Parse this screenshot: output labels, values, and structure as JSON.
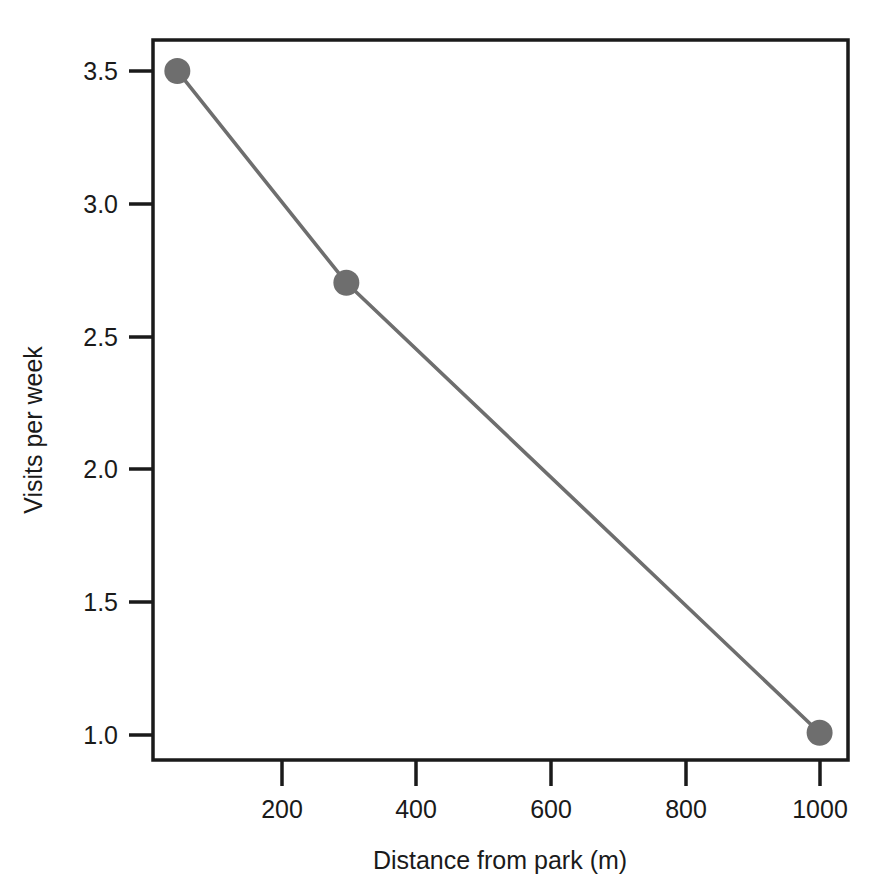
{
  "chart_data": {
    "type": "line",
    "title": "",
    "xlabel": "Distance from park (m)",
    "ylabel": "Visits per week",
    "x": [
      50,
      300,
      1000
    ],
    "values": [
      3.5,
      2.7,
      1.0
    ],
    "series": [
      {
        "name": "Visits per week",
        "x": [
          50,
          300,
          1000
        ],
        "values": [
          3.5,
          2.7,
          1.0
        ]
      }
    ],
    "points": [
      {
        "x": 50,
        "y": 3.5
      },
      {
        "x": 300,
        "y": 2.7
      },
      {
        "x": 1000,
        "y": 1.0
      }
    ],
    "xlim": [
      14,
      1042
    ],
    "ylim": [
      0.897,
      3.617
    ],
    "xticks": [
      200,
      400,
      600,
      800,
      1000
    ],
    "xtick_labels": [
      "200",
      "400",
      "600",
      "800",
      "1000"
    ],
    "yticks": [
      1.0,
      1.5,
      2.0,
      2.5,
      3.0,
      3.5
    ],
    "ytick_labels": [
      "1.0",
      "1.5",
      "2.0",
      "2.5",
      "3.0",
      "3.5"
    ],
    "grid": false,
    "legend": "none",
    "marker": "circle",
    "marker_color": "#6e6e6e",
    "line_color": "#6e6e6e",
    "frame_color": "#1a1a1a",
    "background": "#ffffff"
  }
}
